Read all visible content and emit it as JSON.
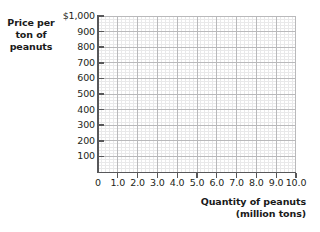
{
  "chart_data": {
    "type": "line",
    "title": "",
    "subtitle": "",
    "series": [],
    "data_points": [],
    "ylabel_lines": [
      "Price per",
      "ton of",
      "peanuts"
    ],
    "ylabel": "Price per ton of peanuts",
    "xlabel_lines": [
      "Quantity of peanuts",
      "(million tons)"
    ],
    "xlabel": "Quantity of peanuts (million tons)",
    "yticks": [
      {
        "value": 1000,
        "label": "$1,000"
      },
      {
        "value": 900,
        "label": "900"
      },
      {
        "value": 800,
        "label": "800"
      },
      {
        "value": 700,
        "label": "700"
      },
      {
        "value": 600,
        "label": "600"
      },
      {
        "value": 500,
        "label": "500"
      },
      {
        "value": 400,
        "label": "400"
      },
      {
        "value": 300,
        "label": "300"
      },
      {
        "value": 200,
        "label": "200"
      },
      {
        "value": 100,
        "label": "100"
      }
    ],
    "xticks": [
      {
        "value": 0,
        "label": "0"
      },
      {
        "value": 1,
        "label": "1.0"
      },
      {
        "value": 2,
        "label": "2.0"
      },
      {
        "value": 3,
        "label": "3.0"
      },
      {
        "value": 4,
        "label": "4.0"
      },
      {
        "value": 5,
        "label": "5.0"
      },
      {
        "value": 6,
        "label": "6.0"
      },
      {
        "value": 7,
        "label": "7.0"
      },
      {
        "value": 8,
        "label": "8.0"
      },
      {
        "value": 9,
        "label": "9.0"
      },
      {
        "value": 10,
        "label": "10.0"
      }
    ],
    "xlim": [
      0,
      10
    ],
    "ylim": [
      0,
      1000
    ],
    "grid": true,
    "grid_minor": true,
    "minor_divisions_per_cell": 5,
    "legend": null,
    "colors": {
      "axis": "#58585a",
      "grid_major": "#b9b9bb",
      "grid_minor": "#e9e9ea",
      "text": "#231f20",
      "background": "#ffffff"
    }
  }
}
